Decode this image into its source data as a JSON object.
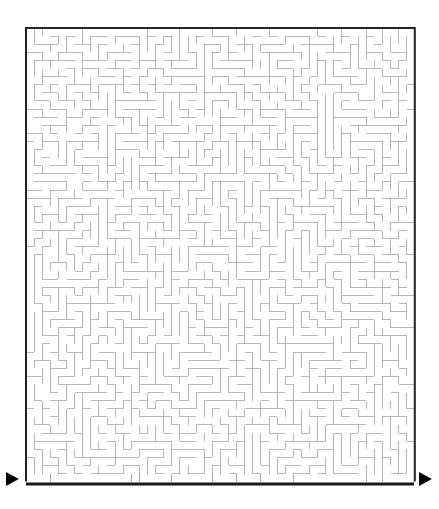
{
  "page": {
    "background_color": "#ffffff",
    "width": 439,
    "height": 509
  },
  "maze": {
    "name": "rectangular-maze",
    "cols": 48,
    "rows": 56,
    "cell_size": 8.1,
    "origin_x": 26,
    "origin_y": 28,
    "wall_color": "#a8a8a8",
    "wall_width": 0.8,
    "border_color": "#222222",
    "border_width": 2.0,
    "baseline": {
      "name": "bottom-baseline",
      "color": "#1a1a1a",
      "width": 3.0,
      "x_start": 26,
      "x_end": 414,
      "y": 484
    },
    "entrance": {
      "label": "",
      "marker": "triangle-right-icon",
      "color": "#000000",
      "x": 6,
      "y": 472,
      "size": 14,
      "side": "bottom-left"
    },
    "exit": {
      "label": "",
      "marker": "triangle-right-icon",
      "color": "#000000",
      "x": 419,
      "y": 472,
      "size": 14,
      "side": "bottom-right"
    },
    "seed": 20240917,
    "wall_density": 0.52
  }
}
